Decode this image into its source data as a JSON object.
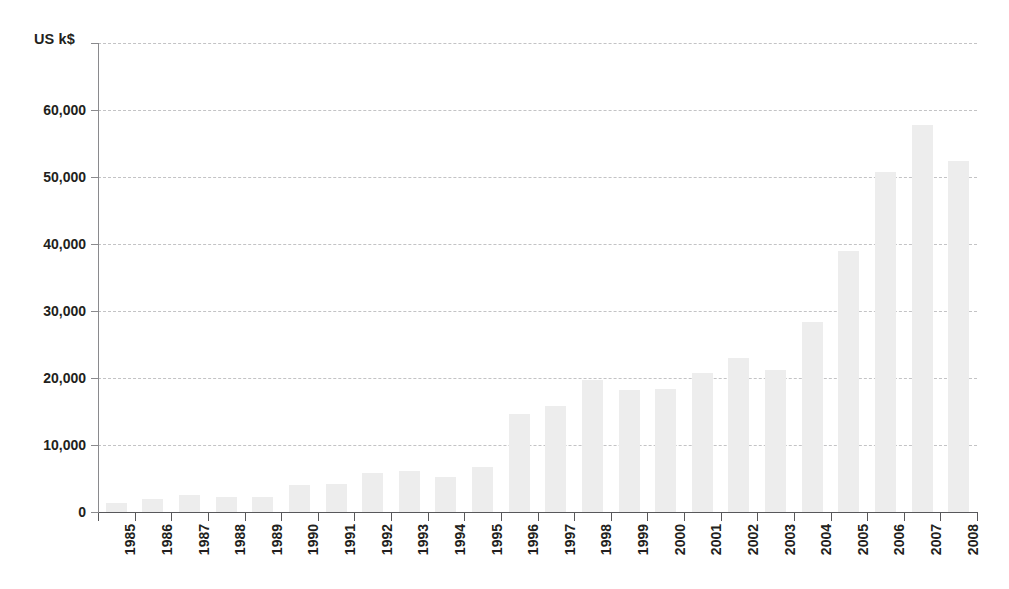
{
  "chart_data": {
    "type": "bar",
    "title": "",
    "subtitle": "",
    "xlabel": "",
    "ylabel": "US k$",
    "ylim": [
      0,
      70000
    ],
    "ytick_values": [
      0,
      10000,
      20000,
      30000,
      40000,
      50000,
      60000
    ],
    "ytick_labels": [
      "0",
      "10,000",
      "20,000",
      "30,000",
      "40,000",
      "50,000",
      "60,000"
    ],
    "grid": true,
    "grid_axis": "y",
    "legend": false,
    "legend_position": "none",
    "bar_color": "#ededed",
    "axis_color": "#58585b",
    "gridline_color": "#b9b9bb",
    "text_color": "#231f20",
    "xtick_rotation": 90,
    "categories": [
      "1985",
      "1986",
      "1987",
      "1988",
      "1989",
      "1990",
      "1991",
      "1992",
      "1993",
      "1994",
      "1995",
      "1996",
      "1997",
      "1998",
      "1999",
      "2000",
      "2001",
      "2002",
      "2003",
      "2004",
      "2005",
      "2006",
      "2007",
      "2008"
    ],
    "values": [
      1300,
      1900,
      2500,
      2300,
      2300,
      4100,
      4200,
      5800,
      6100,
      5200,
      6700,
      14700,
      15800,
      19700,
      18200,
      18300,
      20800,
      23000,
      21200,
      28300,
      38900,
      50800,
      57800,
      52400
    ]
  }
}
